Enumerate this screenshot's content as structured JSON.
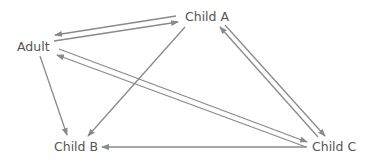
{
  "diagram": {
    "title": "",
    "edge_color": "#8a8a8a",
    "text_color": "#555555",
    "nodes": [
      {
        "id": "adult",
        "label": "Adult",
        "x": 17,
        "y": 41
      },
      {
        "id": "childA",
        "label": "Child A",
        "x": 185,
        "y": 11
      },
      {
        "id": "childB",
        "label": "Child B",
        "x": 54,
        "y": 141
      },
      {
        "id": "childC",
        "label": "Child C",
        "x": 312,
        "y": 141
      }
    ],
    "edges": [
      {
        "from": "childA",
        "to": "adult",
        "x1": 176,
        "y1": 16,
        "x2": 55,
        "y2": 35
      },
      {
        "from": "adult",
        "to": "childA",
        "x1": 54,
        "y1": 41,
        "x2": 178,
        "y2": 22
      },
      {
        "from": "adult",
        "to": "childB",
        "x1": 40,
        "y1": 56,
        "x2": 67,
        "y2": 135
      },
      {
        "from": "childA",
        "to": "childB",
        "x1": 185,
        "y1": 27,
        "x2": 88,
        "y2": 136
      },
      {
        "from": "adult",
        "to": "childC",
        "x1": 59,
        "y1": 49,
        "x2": 307,
        "y2": 142
      },
      {
        "from": "childC",
        "to": "adult",
        "x1": 306,
        "y1": 147,
        "x2": 57,
        "y2": 55
      },
      {
        "from": "childC",
        "to": "childA",
        "x1": 318,
        "y1": 137,
        "x2": 220,
        "y2": 27
      },
      {
        "from": "childA",
        "to": "childC",
        "x1": 225,
        "y1": 25,
        "x2": 325,
        "y2": 136
      },
      {
        "from": "childC",
        "to": "childB",
        "x1": 307,
        "y1": 147,
        "x2": 102,
        "y2": 147
      }
    ]
  }
}
